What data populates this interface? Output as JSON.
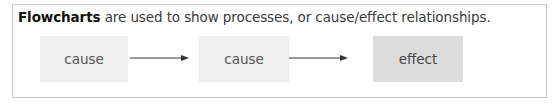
{
  "caption": {
    "bold": "Flowcharts",
    "rest": " are used to show processes, or cause/effect relationships."
  },
  "nodes": [
    {
      "label": "cause",
      "kind": "cause"
    },
    {
      "label": "cause",
      "kind": "cause"
    },
    {
      "label": "effect",
      "kind": "effect"
    }
  ],
  "arrows": [
    {
      "from": 0,
      "to": 1
    },
    {
      "from": 1,
      "to": 2
    }
  ],
  "colors": {
    "cause_fill": "#efefef",
    "effect_fill": "#dcdcdc",
    "arrow": "#333333",
    "border": "#c9c9c9"
  }
}
